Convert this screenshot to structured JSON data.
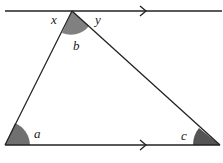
{
  "diagram": {
    "type": "geometry",
    "labels": {
      "x": "x",
      "y": "y",
      "b": "b",
      "a": "a",
      "c": "c"
    },
    "colors": {
      "line": "#222222",
      "shade": "#808080",
      "dark_shade": "#555555"
    }
  }
}
